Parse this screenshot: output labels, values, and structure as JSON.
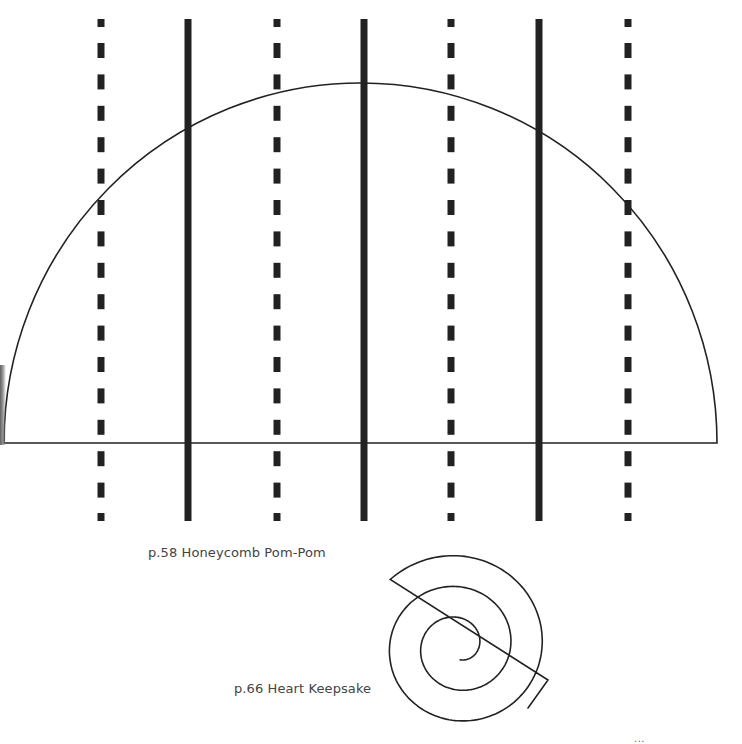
{
  "page": {
    "background": "#ffffff",
    "ink_color": "#222222",
    "text_color": "#444444"
  },
  "templates": [
    {
      "name": "honeycomb-pom-pom",
      "label": "p.58 Honeycomb Pom-Pom",
      "shape": "semicircle",
      "semicircle": {
        "left_x": 4,
        "right_x": 717,
        "baseline_y": 443,
        "top_y": 83
      },
      "fold_lines": [
        {
          "x": 101,
          "style": "dashed"
        },
        {
          "x": 188,
          "style": "solid"
        },
        {
          "x": 277,
          "style": "dashed"
        },
        {
          "x": 364,
          "style": "solid"
        },
        {
          "x": 451,
          "style": "dashed"
        },
        {
          "x": 539,
          "style": "solid"
        },
        {
          "x": 628,
          "style": "dashed"
        }
      ],
      "fold_line_extent": {
        "top_y": 19,
        "bottom_y": 521
      }
    },
    {
      "name": "heart-keepsake",
      "label": "p.66 Heart Keepsake",
      "shape": "spiral",
      "spiral": {
        "center_x": 462,
        "center_y": 640,
        "outer_radius": 94
      }
    }
  ],
  "footer": {
    "code": "..."
  },
  "legend": {
    "dashed_line": "fold-line-dashed",
    "solid_line": "cut-line-solid"
  }
}
